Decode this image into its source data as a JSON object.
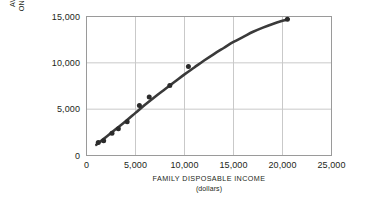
{
  "chart_data": {
    "type": "scatter",
    "title": "",
    "subtitle": "",
    "xlabel": "FAMILY DISPOSABLE INCOME",
    "xlabel_sub": "(dollars)",
    "ylabel_line1": "AVERAGE EXPENDITURE",
    "ylabel_line2": "ON CONSUMPTION (dollars)",
    "xlim": [
      0,
      25000
    ],
    "ylim": [
      0,
      15000
    ],
    "xticks": [
      0,
      5000,
      10000,
      15000,
      20000,
      25000
    ],
    "xtick_labels": [
      "0",
      "5,000",
      "10,000",
      "15,000",
      "20,000",
      "25,000"
    ],
    "yticks": [
      0,
      5000,
      10000,
      15000
    ],
    "ytick_labels": [
      "0",
      "5,000",
      "10,000",
      "15,000"
    ],
    "grid": true,
    "grid_color": "#c9c9c9",
    "frame_color": "#9a9a9a",
    "legend": null,
    "legend_position": "none",
    "series": [
      {
        "name": "Average expenditure on consumption",
        "type": "scatter",
        "marker": "circle",
        "marker_color": "#2b2b2b",
        "points": [
          {
            "x": 1200,
            "y": 1400
          },
          {
            "x": 1750,
            "y": 1600
          },
          {
            "x": 2600,
            "y": 2400
          },
          {
            "x": 3250,
            "y": 2900
          },
          {
            "x": 4150,
            "y": 3650
          },
          {
            "x": 5400,
            "y": 5400
          },
          {
            "x": 6400,
            "y": 6300
          },
          {
            "x": 8500,
            "y": 7550
          },
          {
            "x": 10400,
            "y": 9600
          },
          {
            "x": 20500,
            "y": 14700
          }
        ]
      },
      {
        "name": "Fitted consumption curve",
        "type": "line",
        "line_color": "#3a3a3a",
        "line_width": 2.6,
        "points": [
          {
            "x": 1000,
            "y": 1150
          },
          {
            "x": 2000,
            "y": 2000
          },
          {
            "x": 3000,
            "y": 2850
          },
          {
            "x": 4000,
            "y": 3700
          },
          {
            "x": 5000,
            "y": 4600
          },
          {
            "x": 6000,
            "y": 5500
          },
          {
            "x": 7000,
            "y": 6350
          },
          {
            "x": 8000,
            "y": 7150
          },
          {
            "x": 9000,
            "y": 7950
          },
          {
            "x": 10000,
            "y": 8750
          },
          {
            "x": 11000,
            "y": 9500
          },
          {
            "x": 12000,
            "y": 10250
          },
          {
            "x": 13000,
            "y": 10950
          },
          {
            "x": 14000,
            "y": 11600
          },
          {
            "x": 15000,
            "y": 12250
          },
          {
            "x": 16000,
            "y": 12800
          },
          {
            "x": 17000,
            "y": 13350
          },
          {
            "x": 18000,
            "y": 13800
          },
          {
            "x": 19000,
            "y": 14200
          },
          {
            "x": 20000,
            "y": 14550
          },
          {
            "x": 20600,
            "y": 14720
          }
        ]
      }
    ]
  }
}
